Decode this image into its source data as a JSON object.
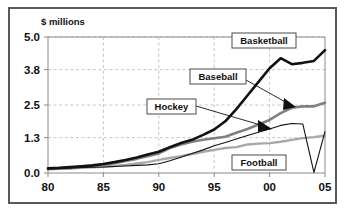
{
  "chart_data": {
    "type": "line",
    "title": "",
    "subtitle": "",
    "xlabel": "",
    "ylabel": "$ millions",
    "x": [
      1980,
      1981,
      1982,
      1983,
      1984,
      1985,
      1986,
      1987,
      1988,
      1989,
      1990,
      1991,
      1992,
      1993,
      1994,
      1995,
      1996,
      1997,
      1998,
      1999,
      2000,
      2001,
      2002,
      2003,
      2004,
      2005
    ],
    "x_tick_labels": [
      "80",
      "85",
      "90",
      "95",
      "00",
      "05"
    ],
    "x_tick_values": [
      1980,
      1985,
      1990,
      1995,
      2000,
      2005
    ],
    "y_tick_labels": [
      "0.0",
      "1.3",
      "2.5",
      "3.8",
      "5.0"
    ],
    "y_tick_values": [
      0.0,
      1.3,
      2.5,
      3.8,
      5.0
    ],
    "xlim": [
      1980,
      2005
    ],
    "ylim": [
      0.0,
      5.0
    ],
    "grid": true,
    "legend_position": "inline-callouts",
    "series": [
      {
        "name": "Basketball",
        "color": "#111111",
        "width": 2.6,
        "values": [
          0.17,
          0.19,
          0.22,
          0.25,
          0.28,
          0.33,
          0.4,
          0.48,
          0.57,
          0.68,
          0.78,
          0.95,
          1.1,
          1.22,
          1.4,
          1.6,
          1.9,
          2.35,
          2.85,
          3.35,
          3.85,
          4.22,
          4.0,
          4.05,
          4.12,
          4.52
        ]
      },
      {
        "name": "Baseball",
        "color": "#808080",
        "width": 2.6,
        "values": [
          0.14,
          0.16,
          0.18,
          0.21,
          0.25,
          0.3,
          0.36,
          0.44,
          0.52,
          0.62,
          0.72,
          0.92,
          1.05,
          1.15,
          1.22,
          1.28,
          1.33,
          1.48,
          1.62,
          1.78,
          1.95,
          2.2,
          2.4,
          2.45,
          2.45,
          2.58
        ]
      },
      {
        "name": "Hockey",
        "color": "#111111",
        "width": 1.1,
        "values": [
          0.16,
          0.17,
          0.18,
          0.2,
          0.21,
          0.22,
          0.24,
          0.26,
          0.28,
          0.3,
          0.34,
          0.45,
          0.58,
          0.72,
          0.85,
          1.0,
          1.12,
          1.25,
          1.38,
          1.5,
          1.62,
          1.75,
          1.82,
          1.8,
          0.02,
          1.52
        ]
      },
      {
        "name": "Football",
        "color": "#a8a8a8",
        "width": 2.4,
        "values": [
          0.15,
          0.16,
          0.17,
          0.19,
          0.21,
          0.23,
          0.26,
          0.3,
          0.35,
          0.4,
          0.48,
          0.55,
          0.62,
          0.7,
          0.78,
          0.85,
          0.92,
          0.95,
          1.05,
          1.08,
          1.1,
          1.15,
          1.22,
          1.28,
          1.32,
          1.38
        ]
      }
    ],
    "callouts": [
      {
        "label": "Basketball",
        "box_x": 232,
        "box_y": 33,
        "box_w": 64,
        "box_h": 15
      },
      {
        "label": "Baseball",
        "box_x": 190,
        "box_y": 69,
        "box_w": 56,
        "box_h": 15
      },
      {
        "label": "Hockey",
        "box_x": 147,
        "box_y": 99,
        "box_w": 49,
        "box_h": 15
      },
      {
        "label": "Football",
        "box_x": 232,
        "box_y": 155,
        "box_w": 54,
        "box_h": 15
      }
    ]
  },
  "axis": {
    "y_title": "$ millions"
  }
}
